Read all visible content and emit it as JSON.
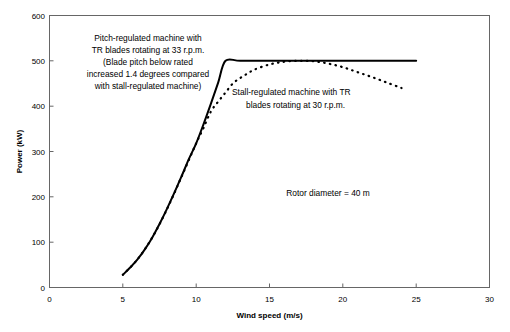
{
  "chart_data": {
    "type": "line",
    "title": "",
    "xlabel": "Wind speed (m/s)",
    "ylabel": "Power (kW)",
    "xlim": [
      0,
      30
    ],
    "ylim": [
      0,
      600
    ],
    "xticks": [
      "0",
      "5",
      "10",
      "15",
      "20",
      "25",
      "30"
    ],
    "yticks": [
      "0",
      "100",
      "200",
      "300",
      "400",
      "500",
      "600"
    ],
    "xtick_values": [
      0,
      5,
      10,
      15,
      20,
      25,
      30
    ],
    "ytick_values": [
      0,
      100,
      200,
      300,
      400,
      500,
      600
    ],
    "grid": false,
    "legend": "none",
    "series": [
      {
        "name": "Pitch-regulated machine with TR blades rotating at 33 r.p.m.",
        "style": "solid",
        "color": "#000000",
        "x": [
          5.0,
          5.5,
          6.0,
          6.5,
          7.0,
          7.5,
          8.0,
          8.5,
          9.0,
          9.5,
          10.0,
          10.5,
          11.0,
          11.5,
          12.0,
          13.0,
          15.0,
          17.0,
          19.0,
          21.0,
          23.0,
          25.0
        ],
        "values": [
          28,
          44,
          62,
          84,
          110,
          140,
          173,
          208,
          245,
          283,
          318,
          360,
          405,
          452,
          500,
          500,
          500,
          500,
          500,
          500,
          500,
          500
        ]
      },
      {
        "name": "Stall-regulated machine with TR blades rotating at 30 r.p.m.",
        "style": "dotted",
        "color": "#000000",
        "x": [
          5.0,
          6.0,
          7.0,
          8.0,
          9.0,
          10.0,
          10.5,
          11.0,
          11.5,
          12.0,
          12.5,
          13.0,
          13.5,
          14.0,
          15.0,
          16.0,
          17.0,
          18.0,
          19.0,
          20.0,
          21.0,
          22.0,
          23.0,
          24.0
        ],
        "values": [
          28,
          62,
          110,
          172,
          244,
          318,
          352,
          388,
          410,
          430,
          450,
          462,
          472,
          481,
          492,
          498,
          500,
          499,
          494,
          486,
          475,
          464,
          452,
          440
        ]
      }
    ],
    "annotations": [
      {
        "name": "pitch-regulated-annotation",
        "lines": [
          "Pitch-regulated machine with",
          "TR blades rotating at 33 r.p.m.",
          "(Blade pitch below rated",
          "increased 1.4 degrees compared",
          "with stall-regulated machine)"
        ]
      },
      {
        "name": "stall-regulated-annotation",
        "lines": [
          "Stall-regulated machine with TR",
          "blades rotating at 30 r.p.m."
        ]
      },
      {
        "name": "rotor-diameter-annotation",
        "lines": [
          "Rotor diameter = 40 m"
        ]
      }
    ]
  },
  "axes": {
    "x_title": "Wind speed (m/s)",
    "y_title": "Power (kW)",
    "x_labels": [
      "0",
      "5",
      "10",
      "15",
      "20",
      "25",
      "30"
    ],
    "y_labels": [
      "600",
      "500",
      "400",
      "300",
      "200",
      "100",
      "0"
    ]
  },
  "annotations": {
    "pitch": {
      "l1": "Pitch-regulated machine with",
      "l2": "TR blades rotating at 33 r.p.m.",
      "l3": "(Blade pitch below rated",
      "l4": "increased 1.4 degrees compared",
      "l5": "with stall-regulated machine)"
    },
    "stall": {
      "l1": "Stall-regulated machine with TR",
      "l2": "blades rotating at 30 r.p.m."
    },
    "rotor": {
      "l1": "Rotor diameter = 40 m"
    }
  },
  "colors": {
    "line": "#000000",
    "frame": "#666666",
    "background": "#ffffff"
  }
}
